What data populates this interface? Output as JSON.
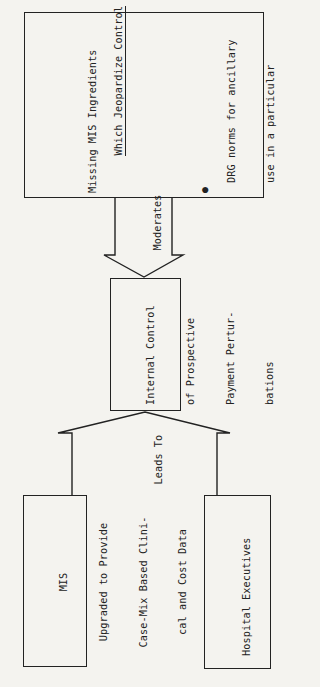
{
  "diagram": {
    "orientation": "rotated-90-ccw",
    "missing_box": {
      "title_lines": [
        "Missing MIS Ingredients",
        "Which Jeopardize Control"
      ],
      "items": [
        {
          "lines": [
            "DRG norms for ancillary",
            "use in a particular",
            "hospital"
          ]
        },
        {
          "lines": [
            "Valid peer group cost",
            "comparisons for",
            "physicians"
          ]
        },
        {
          "lines": [
            "Clinical feedback on",
            "cost effective",
            "treatment"
          ]
        },
        {
          "lines": [
            "Non-accounting orien-",
            "tation of MIS"
          ]
        }
      ]
    },
    "moderates_arrow": {
      "label": "Moderates"
    },
    "center_box": {
      "lines": [
        "Internal Control",
        "of Prospective",
        "Payment Pertur-",
        "bations"
      ]
    },
    "leads_to_arrow": {
      "label": "Leads To"
    },
    "mis_box": {
      "lines": [
        "MIS",
        "Upgraded to Provide",
        "Case-Mix Based Clini-",
        "cal and Cost Data"
      ]
    },
    "executives_box": {
      "lines": [
        "Hospital Executives",
        "Tracking Costs and",
        "Revenues"
      ]
    },
    "colors": {
      "ink": "#222222",
      "paper": "#f4f3ef"
    }
  }
}
